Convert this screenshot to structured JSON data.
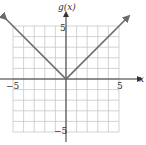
{
  "chart_data": {
    "type": "line",
    "title": "",
    "function_label": "g(x)",
    "xlabel": "x",
    "ylabel": "g(x)",
    "xlim": [
      -5,
      5
    ],
    "ylim": [
      -5,
      5
    ],
    "grid": true,
    "grid_step": 1,
    "tick_labels": {
      "x": [
        "-5",
        "5"
      ],
      "y": [
        "5",
        "-5"
      ]
    },
    "series": [
      {
        "name": "g(x) = |x|",
        "x": [
          -5.8,
          0,
          5.8
        ],
        "y": [
          5.8,
          0,
          5.8
        ]
      }
    ],
    "arrows_on_ends": true
  },
  "labels": {
    "y_axis": "g(x)",
    "x_axis": "x",
    "x_neg": "−5",
    "x_pos": "5",
    "y_pos": "5",
    "y_neg": "−5"
  },
  "colors": {
    "grid": "#c8c8c8",
    "axis": "#333333",
    "curve": "#6b6b6b"
  }
}
